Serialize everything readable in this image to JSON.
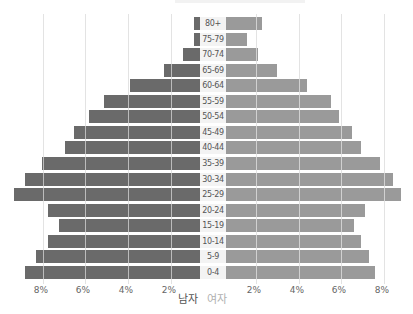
{
  "chart_data": {
    "type": "bar",
    "orientation": "horizontal-pyramid",
    "title": "",
    "categories": [
      "80+",
      "75-79",
      "70-74",
      "65-69",
      "60-64",
      "55-59",
      "50-54",
      "45-49",
      "40-44",
      "35-39",
      "30-34",
      "25-29",
      "20-24",
      "15-19",
      "10-14",
      "5-9",
      "0-4"
    ],
    "series": [
      {
        "name": "남자",
        "side": "left",
        "color": "#6a6a6a",
        "values": [
          0.3,
          0.3,
          0.8,
          1.7,
          3.3,
          4.5,
          5.2,
          5.9,
          6.3,
          7.4,
          8.2,
          8.7,
          7.1,
          6.6,
          7.1,
          7.7,
          8.2
        ]
      },
      {
        "name": "여자",
        "side": "right",
        "color": "#9a9a9a",
        "values": [
          1.7,
          1.0,
          1.5,
          2.4,
          3.8,
          4.9,
          5.3,
          5.9,
          6.3,
          7.2,
          7.8,
          8.2,
          6.5,
          6.0,
          6.3,
          6.7,
          7.0
        ]
      }
    ],
    "x_ticks_left": [
      "8%",
      "6%",
      "4%",
      "2%"
    ],
    "x_ticks_right": [
      "2%",
      "4%",
      "6%",
      "8%"
    ],
    "xlabel": "",
    "ylabel": "",
    "xlim": [
      0,
      9
    ],
    "unit": "%",
    "grid": true,
    "legend": {
      "position": "bottom-center",
      "entries": [
        "남자",
        "여자"
      ]
    }
  },
  "labels": {
    "male": "남자",
    "female": "여자"
  }
}
